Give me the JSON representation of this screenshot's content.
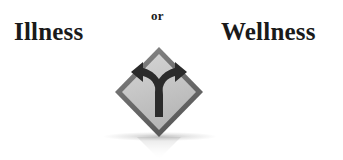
{
  "canvas": {
    "width": 343,
    "height": 160,
    "background_color": "#ffffff"
  },
  "headline": {
    "left_word": "Illness",
    "conjunction": "or",
    "right_word": "Wellness",
    "text_color": "#1a1a1a"
  },
  "sign": {
    "icon_name": "fork-in-the-road-sign",
    "shape": "diamond",
    "border_color": "#6e6e6e",
    "face_color": "#c9c9c9",
    "arrow_color": "#2b2b2b",
    "left_arrow_name": "curved-arrow-left",
    "right_arrow_name": "curved-arrow-right",
    "shadow_color": "#8a8a8a"
  }
}
